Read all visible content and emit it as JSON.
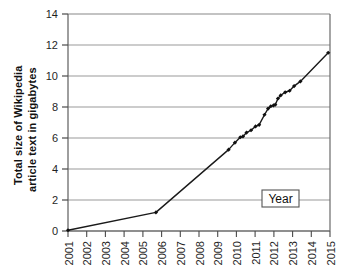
{
  "chart_data": {
    "type": "line",
    "title": "",
    "subtitle": "",
    "xlabel": "Year",
    "ylabel": "Total size of Wikipedia article text in gigabytes",
    "ylabel_line1": "Total size of Wikipedia",
    "ylabel_line2": "article text in gigabytes",
    "xlim": [
      2001,
      2015.6
    ],
    "ylim": [
      0,
      14
    ],
    "yticks": [
      0,
      2,
      4,
      6,
      8,
      10,
      12,
      14
    ],
    "ytick_labels": [
      "0",
      "2",
      "4",
      "6",
      "8",
      "10",
      "12",
      "14"
    ],
    "xticks": [
      2001,
      2002,
      2003,
      2004,
      2005,
      2006,
      2007,
      2008,
      2009,
      2010,
      2011,
      2012,
      2013,
      2014,
      2015
    ],
    "xtick_labels": [
      "2001",
      "2002",
      "2003",
      "2004",
      "2005",
      "2006",
      "2007",
      "2008",
      "2009",
      "2010",
      "2011",
      "2012",
      "2013",
      "2014",
      "2015"
    ],
    "grid": "horizontal",
    "legend": "none",
    "marker": "diamond",
    "line_color": "#1a1a1a",
    "marker_color": "#111111",
    "grid_color": "#999999",
    "axis_color": "#555555",
    "series": [
      {
        "name": "Total size of Wikipedia article text in gigabytes",
        "x": [
          2001.0,
          2005.9,
          2009.95,
          2010.3,
          2010.6,
          2010.75,
          2010.95,
          2011.2,
          2011.45,
          2011.65,
          2011.95,
          2012.15,
          2012.3,
          2012.45,
          2012.55,
          2012.7,
          2012.85,
          2013.1,
          2013.35,
          2013.6,
          2013.95,
          2015.5
        ],
        "y": [
          0.05,
          1.2,
          5.25,
          5.7,
          6.05,
          6.1,
          6.35,
          6.5,
          6.75,
          6.85,
          7.5,
          7.9,
          8.05,
          8.1,
          8.15,
          8.55,
          8.75,
          8.95,
          9.05,
          9.35,
          9.65,
          11.5
        ]
      }
    ],
    "annotations": [
      {
        "name": "x-axis-title-box",
        "text": "Year",
        "x": 2013.6,
        "y": 2.0,
        "boxed": true
      }
    ]
  }
}
